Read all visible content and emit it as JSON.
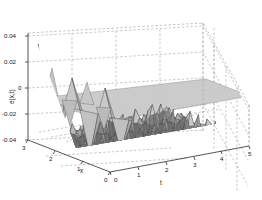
{
  "figure": {
    "kind": "matlab-3d-surface-plot",
    "background_color": "#ffffff",
    "axis_color": "#2b2b2b",
    "grid_color": "#9a9a9a",
    "mesh_edge_color": "#4a4a4a",
    "mesh_face_color": "#b9b9b9"
  },
  "axes": {
    "z": {
      "label": "e(x,t)",
      "ticks": [
        "0.04",
        "0.02",
        "0",
        "-0.02",
        "-0.04"
      ],
      "values": [
        0.04,
        0.02,
        0,
        -0.02,
        -0.04
      ],
      "min": -0.04,
      "max": 0.04
    },
    "x": {
      "label": "x",
      "ticks": [
        "3",
        "2",
        "1",
        "0"
      ],
      "values": [
        3,
        2,
        1,
        0
      ],
      "min": 0,
      "max": 3
    },
    "t": {
      "label": "t",
      "ticks": [
        "0",
        "1",
        "2",
        "3",
        "4",
        "5"
      ],
      "values": [
        0,
        1,
        2,
        3,
        4,
        5
      ],
      "min": 0,
      "max": 5
    }
  },
  "chart_data": {
    "type": "surface",
    "title": "",
    "xlabel": "x",
    "ylabel": "t",
    "zlabel": "e(x,t)",
    "xlim": [
      0,
      3
    ],
    "ylim": [
      0,
      5
    ],
    "zlim": [
      -0.04,
      0.04
    ],
    "grid": true,
    "legend": null,
    "x": [
      0.0,
      0.25,
      0.5,
      0.75,
      1.0,
      1.25,
      1.5,
      1.75,
      2.0,
      2.25,
      2.5,
      2.75,
      3.0
    ],
    "t": [
      0.0,
      0.42,
      0.83,
      1.25,
      1.67,
      2.08,
      2.5,
      2.92,
      3.33,
      3.75,
      4.17,
      4.58,
      5.0
    ],
    "z": [
      [
        0.0,
        -0.031,
        0.034,
        -0.028,
        0.006,
        -0.02,
        0.016,
        -0.034,
        0.03,
        -0.012,
        0.022,
        -0.026,
        0.0
      ],
      [
        0.0,
        -0.012,
        0.014,
        -0.011,
        0.003,
        -0.009,
        0.007,
        -0.013,
        0.012,
        -0.005,
        0.009,
        -0.01,
        0.0
      ],
      [
        0.0,
        -0.009,
        0.01,
        -0.008,
        0.002,
        -0.007,
        0.005,
        -0.01,
        0.009,
        -0.004,
        0.007,
        -0.008,
        0.0
      ],
      [
        0.0,
        -0.008,
        0.009,
        -0.007,
        0.002,
        -0.006,
        0.005,
        -0.009,
        0.008,
        -0.003,
        0.006,
        -0.007,
        0.0
      ],
      [
        0.0,
        -0.007,
        0.008,
        -0.007,
        0.002,
        -0.005,
        0.004,
        -0.008,
        0.007,
        -0.003,
        0.006,
        -0.006,
        0.0
      ],
      [
        0.0,
        -0.007,
        0.008,
        -0.006,
        0.002,
        -0.005,
        0.004,
        -0.008,
        0.007,
        -0.003,
        0.005,
        -0.006,
        0.0
      ],
      [
        0.0,
        -0.006,
        0.007,
        -0.006,
        0.001,
        -0.005,
        0.004,
        -0.007,
        0.006,
        -0.003,
        0.005,
        -0.006,
        0.0
      ],
      [
        0.0,
        -0.006,
        0.007,
        -0.006,
        0.001,
        -0.004,
        0.004,
        -0.007,
        0.006,
        -0.002,
        0.005,
        -0.005,
        0.0
      ],
      [
        0.0,
        -0.006,
        0.006,
        -0.005,
        0.001,
        -0.004,
        0.003,
        -0.006,
        0.006,
        -0.002,
        0.004,
        -0.005,
        0.0
      ],
      [
        0.0,
        -0.005,
        0.006,
        -0.005,
        0.001,
        -0.004,
        0.003,
        -0.006,
        0.005,
        -0.002,
        0.004,
        -0.005,
        0.0
      ],
      [
        0.0,
        -0.005,
        0.006,
        -0.005,
        0.001,
        -0.004,
        0.003,
        -0.006,
        0.005,
        -0.002,
        0.004,
        -0.004,
        0.0
      ],
      [
        0.0,
        -0.005,
        0.005,
        -0.004,
        0.001,
        -0.003,
        0.003,
        -0.005,
        0.005,
        -0.002,
        0.004,
        -0.004,
        0.0
      ],
      [
        0.0,
        -0.004,
        0.005,
        -0.004,
        0.001,
        -0.003,
        0.003,
        -0.005,
        0.004,
        -0.002,
        0.003,
        -0.004,
        0.0
      ]
    ]
  },
  "tick_labels": {
    "z": {
      "t0": "0.04",
      "t1": "0.02",
      "t2": "0",
      "t3": "-0.02",
      "t4": "-0.04"
    },
    "x": {
      "t0": "3",
      "t1": "2",
      "t2": "1",
      "t3": "0"
    },
    "t": {
      "t0": "0",
      "t1": "1",
      "t2": "2",
      "t3": "3",
      "t4": "4",
      "t5": "5"
    }
  },
  "labels": {
    "z_axis": "e(x,t)",
    "x_axis": "x",
    "t_axis": "t"
  }
}
